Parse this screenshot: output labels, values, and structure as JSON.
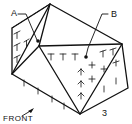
{
  "diagram": {
    "type": "isometric-block-sketch",
    "labels": {
      "point_a": "A",
      "point_b": "B",
      "corner_3": "3",
      "front": "FRONT"
    },
    "colors": {
      "line": "#111111",
      "background": "#ffffff"
    }
  }
}
